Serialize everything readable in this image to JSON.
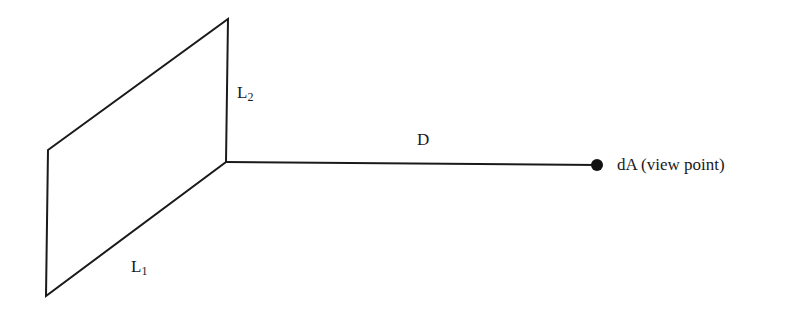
{
  "diagram": {
    "type": "view-factor-geometry",
    "colors": {
      "stroke": "#1a1a1a",
      "background": "#ffffff",
      "point": "#111111"
    },
    "plate": {
      "corners": {
        "top_left": [
          48,
          150
        ],
        "top_right": [
          228,
          19
        ],
        "bottom_right": [
          226,
          162
        ],
        "bottom_left": [
          46,
          296
        ]
      },
      "edge_labels": {
        "l1": {
          "main": "L",
          "sub": "1"
        },
        "l2": {
          "main": "L",
          "sub": "2"
        }
      }
    },
    "distance_line": {
      "from": [
        226,
        162
      ],
      "to": [
        597,
        165
      ],
      "label": "D"
    },
    "view_point": {
      "center": [
        597,
        165
      ],
      "radius": 6,
      "label": "dA (view point)"
    }
  }
}
